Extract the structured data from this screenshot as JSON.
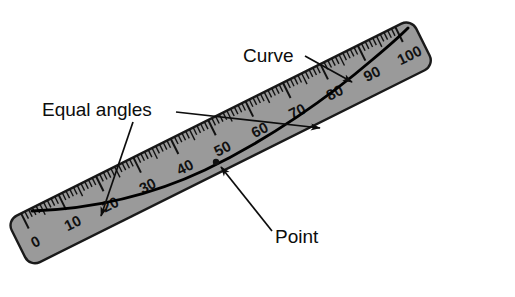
{
  "figure": {
    "background_color": "#ffffff"
  },
  "ruler": {
    "name": "ruler",
    "fill_color": "#9a9a9a",
    "edge_color": "#1a1a1a",
    "scale_min": 0,
    "scale_max": 100,
    "major_labels": [
      "0",
      "10",
      "20",
      "30",
      "40",
      "50",
      "60",
      "70",
      "80",
      "90",
      "100"
    ],
    "major_step": 10,
    "minor_step": 1,
    "mid_step": 5,
    "angle_degrees": -26.5
  },
  "curve": {
    "name": "curve",
    "color": "#000000",
    "description": "upward-bending curve tangent to the ruler edge"
  },
  "annotations": [
    {
      "id": "curve",
      "label": "Curve",
      "x": 243,
      "y": 62,
      "anchor": "start",
      "leader": "line from label to curve with arrowhead"
    },
    {
      "id": "equal-angles",
      "label": "Equal angles",
      "x": 42,
      "y": 116,
      "anchor": "start",
      "leader": "two leader lines with arrowheads to the two intersection angles"
    },
    {
      "id": "point",
      "label": "Point",
      "x": 275,
      "y": 243,
      "anchor": "start",
      "leader": "line from label up-left to the tangency point with arrowhead"
    }
  ]
}
